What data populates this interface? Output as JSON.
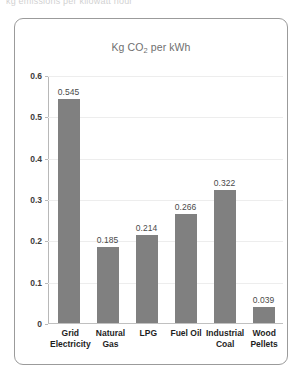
{
  "top_cropped_text": "kg emissions per kilowatt hour",
  "chart_data": {
    "type": "bar",
    "title": "Kg CO2 per kWh",
    "title_prefix": "Kg CO",
    "title_subscript": "2",
    "title_suffix": " per kWh",
    "xlabel": "",
    "ylabel": "",
    "ylim": [
      0,
      0.6
    ],
    "grid": true,
    "legend": "none",
    "bar_color": "#808080",
    "categories": [
      "Grid Electricity",
      "Natural Gas",
      "LPG",
      "Fuel Oil",
      "Industrial Coal",
      "Wood Pellets"
    ],
    "values": [
      0.545,
      0.185,
      0.214,
      0.266,
      0.322,
      0.039
    ],
    "value_labels": [
      "0.545",
      "0.185",
      "0.214",
      "0.266",
      "0.322",
      "0.039"
    ],
    "ytick_labels": [
      "0.6",
      "0.5",
      "0.4",
      "0.3",
      "0.2",
      "0.1",
      "0"
    ],
    "ytick_values": [
      0.6,
      0.5,
      0.4,
      0.3,
      0.2,
      0.1,
      0
    ]
  }
}
